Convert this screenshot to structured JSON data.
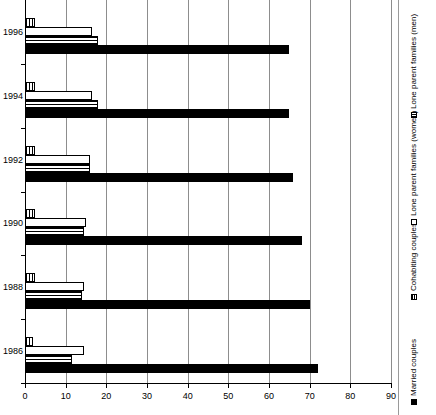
{
  "chart_data": {
    "type": "bar",
    "orientation": "horizontal",
    "title": "",
    "xlabel": "",
    "ylabel": "",
    "xlim": [
      0,
      90
    ],
    "xticks": [
      0,
      10,
      20,
      30,
      40,
      50,
      60,
      70,
      80,
      90
    ],
    "xtick_labels": [
      "0",
      "10",
      "20",
      "30",
      "40",
      "50",
      "60",
      "70",
      "80",
      "90"
    ],
    "grid": true,
    "grid_axis": "x",
    "legend_position": "right-vertical",
    "categories": [
      "1986",
      "1988",
      "1990",
      "1992",
      "1994",
      "1996"
    ],
    "series": [
      {
        "name": "Married couples",
        "fill": "solid-black",
        "color": "#000000",
        "values": [
          72,
          70,
          68,
          66,
          65,
          65
        ]
      },
      {
        "name": "Cohabiting couples",
        "fill": "horizontal-lines",
        "color": "#000000",
        "values": [
          11.5,
          14,
          14.5,
          16,
          18,
          18
        ]
      },
      {
        "name": "Lone parent families (women)",
        "fill": "open-white",
        "color": "#ffffff",
        "values": [
          14.5,
          14.5,
          15,
          16,
          16.5,
          16.5
        ]
      },
      {
        "name": "Lone parent families (men)",
        "fill": "vertical-lines",
        "color": "#000000",
        "values": [
          2,
          2.5,
          2.5,
          2.5,
          2.5,
          2.5
        ]
      }
    ]
  },
  "legend": {
    "items": [
      {
        "label": "Married couples",
        "swatch": "married"
      },
      {
        "label": "Cohabiting couples",
        "swatch": "cohab"
      },
      {
        "label": "Lone parent families (women)",
        "swatch": "lonewomen"
      },
      {
        "label": "Lone parent families (men)",
        "swatch": "lonemen"
      }
    ]
  }
}
